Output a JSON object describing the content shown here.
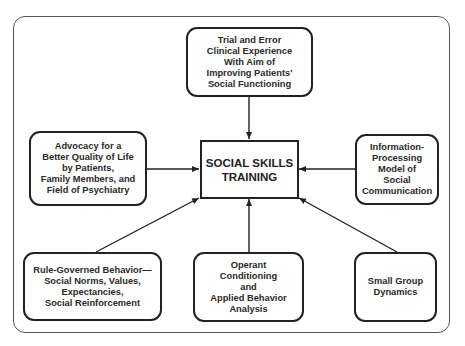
{
  "diagram": {
    "type": "influence-diagram",
    "center": {
      "id": "social-skills-training",
      "label": "SOCIAL SKILLS\nTRAINING"
    },
    "nodes": [
      {
        "id": "trial-and-error",
        "position": "top",
        "label": "Trial and Error\nClinical Experience\nWith Aim of\nImproving Patients'\nSocial Functioning"
      },
      {
        "id": "advocacy",
        "position": "left",
        "label": "Advocacy for a\nBetter Quality of Life\nby Patients,\nFamily Members, and\nField of Psychiatry"
      },
      {
        "id": "information-processing",
        "position": "right",
        "label": "Information-\nProcessing\nModel of\nSocial\nCommunication"
      },
      {
        "id": "rule-governed-behavior",
        "position": "bottom-left",
        "label": "Rule-Governed Behavior—\nSocial Norms, Values,\nExpectancies,\nSocial Reinforcement"
      },
      {
        "id": "operant-conditioning",
        "position": "bottom-center",
        "label": "Operant\nConditioning\nand\nApplied Behavior\nAnalysis"
      },
      {
        "id": "small-group-dynamics",
        "position": "bottom-right",
        "label": "Small Group\nDynamics"
      }
    ],
    "edges": [
      {
        "from": "trial-and-error",
        "to": "social-skills-training"
      },
      {
        "from": "advocacy",
        "to": "social-skills-training"
      },
      {
        "from": "information-processing",
        "to": "social-skills-training"
      },
      {
        "from": "rule-governed-behavior",
        "to": "social-skills-training"
      },
      {
        "from": "operant-conditioning",
        "to": "social-skills-training"
      },
      {
        "from": "small-group-dynamics",
        "to": "social-skills-training"
      }
    ],
    "colors": {
      "stroke": "#222222",
      "frame": "#555555",
      "text": "#2a2a2a",
      "background": "#ffffff"
    }
  }
}
